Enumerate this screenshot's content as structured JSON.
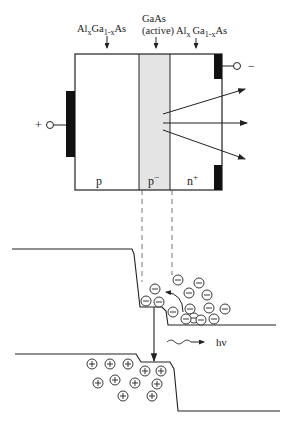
{
  "diagram": {
    "layers": {
      "left": {
        "material_main": "Al",
        "sub1": "x",
        "material_mid": "Ga",
        "sub2": "1-x",
        "material_end": "As",
        "doping": "p"
      },
      "active": {
        "line1": "GaAs",
        "line2": "(active)",
        "doping": "p",
        "doping_sup": "−"
      },
      "right": {
        "material_main": "Al",
        "sub1": "x",
        "material_mid": "Ga",
        "sub2": "1-x",
        "material_end": "As",
        "doping": "n",
        "doping_sup": "+"
      }
    },
    "terminals": {
      "positive": "+",
      "negative": "−"
    },
    "emission_label": "hν",
    "carriers": {
      "electron_symbol": "⊖",
      "hole_symbol": "⊕",
      "electron_count": 16,
      "hole_count": 11
    },
    "colors": {
      "line": "#222222",
      "active_fill": "#e4e4e4",
      "contact": "#111111"
    }
  }
}
